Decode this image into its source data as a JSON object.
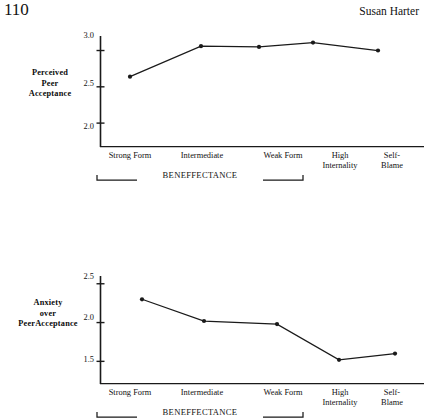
{
  "running_head": {
    "page_number": "110",
    "author": "Susan Harter"
  },
  "axis": {
    "categories": [
      "Strong Form",
      "Intermediate",
      "Weak Form",
      "High Internality",
      "Self-Blame"
    ],
    "category_lines": [
      [
        "Strong Form"
      ],
      [
        "Intermediate"
      ],
      [
        "Weak Form"
      ],
      [
        "High",
        "Internality"
      ],
      [
        "Self-",
        "Blame"
      ]
    ],
    "group_bracket_label": "BENEFFECTANCE",
    "group_bracket_members": [
      "Strong Form",
      "Intermediate",
      "Weak Form"
    ]
  },
  "figures": {
    "top": {
      "y_label_lines": [
        "Perceived",
        "Peer",
        "Acceptance"
      ],
      "y_ticks": [
        "3.0",
        "2.5",
        "2.0"
      ]
    },
    "bottom": {
      "y_label_lines": [
        "Anxiety",
        "over",
        "PeerAcceptance"
      ],
      "y_ticks": [
        "2.5",
        "2.0",
        "1.5"
      ]
    }
  },
  "chart_data": [
    {
      "id": "perceived-peer-acceptance",
      "type": "line",
      "title": "",
      "xlabel": "BENEFFECTANCE",
      "ylabel": "Perceived Peer Acceptance",
      "categories": [
        "Strong Form",
        "Intermediate",
        "Weak Form",
        "High Internality",
        "Self-Blame"
      ],
      "values": [
        2.64,
        3.06,
        3.05,
        3.11,
        3.0
      ],
      "ylim": [
        1.85,
        3.2
      ],
      "yticks": [
        3.0,
        2.5,
        2.0
      ],
      "grid": false,
      "legend": "none",
      "marker": "filled-circle",
      "line_color": "#1a1a1a"
    },
    {
      "id": "anxiety-over-peer-acceptance",
      "type": "line",
      "title": "",
      "xlabel": "BENEFFECTANCE",
      "ylabel": "Anxiety over PeerAcceptance",
      "categories": [
        "Strong Form",
        "Intermediate",
        "Weak Form",
        "High Internality",
        "Self-Blame"
      ],
      "values": [
        2.3,
        2.02,
        1.98,
        1.52,
        1.6
      ],
      "ylim": [
        1.35,
        2.6
      ],
      "yticks": [
        2.5,
        2.0,
        1.5
      ],
      "grid": false,
      "legend": "none",
      "marker": "filled-circle",
      "line_color": "#1a1a1a"
    }
  ]
}
